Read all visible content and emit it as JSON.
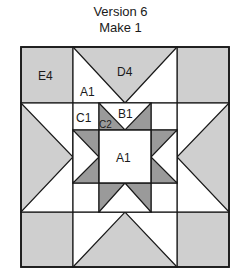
{
  "title": {
    "line1": "Version 6",
    "line2": "Make 1"
  },
  "colors": {
    "light_gray": "#cfcfcf",
    "dark_gray": "#9a9a9a",
    "white": "#ffffff",
    "line": "#1a1a1a"
  },
  "block": {
    "outer": {
      "x": 21,
      "y": 47,
      "size_w": 208,
      "size_h": 220
    },
    "labels": {
      "corner": "E4",
      "outer_goose": "D4",
      "outer_goose_bg": "A1",
      "inner_corner": "C1",
      "inner_goose": "B1",
      "inner_goose_point": "C2",
      "center": "A1"
    }
  }
}
